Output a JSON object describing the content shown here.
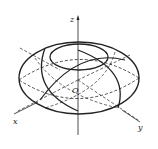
{
  "diagram": {
    "labels": {
      "z_axis": "z",
      "x_axis": "x",
      "y_axis": "y",
      "origin": "O"
    },
    "colors": {
      "line": "#222222",
      "background": "#ffffff"
    }
  }
}
